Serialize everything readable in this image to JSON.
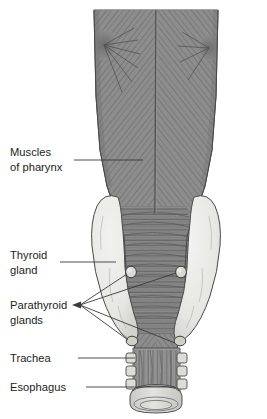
{
  "figure": {
    "view": "posterior",
    "background_color": "#ffffff",
    "width": 267,
    "height": 419
  },
  "palette": {
    "muscle_fill": "#8d8d8d",
    "muscle_fiber": "#5c5c5c",
    "muscle_dark": "#6f6f6f",
    "thyroid_fill": "#e9e9e6",
    "thyroid_shade": "#d3d3cf",
    "parathyroid_fill": "#d8d8d4",
    "trachea_fill": "#9a9a9a",
    "cartilage_fill": "#dcdcd8",
    "outline": "#4a4a4a",
    "leader_line": "#3b3b3b",
    "label_text": "#1d1d1d"
  },
  "labels": [
    {
      "id": "muscles-of-pharynx",
      "lines": [
        "Muscles",
        "of pharynx"
      ],
      "line1": "Muscles",
      "line2": "of pharynx",
      "text_x": 10,
      "text_y": 156,
      "leader": "single",
      "pointer_count": 1
    },
    {
      "id": "thyroid-gland",
      "lines": [
        "Thyroid",
        "gland"
      ],
      "line1": "Thyroid",
      "line2": "gland",
      "text_x": 10,
      "text_y": 259,
      "leader": "single",
      "pointer_count": 1
    },
    {
      "id": "parathyroid-glands",
      "lines": [
        "Parathyroid",
        "glands"
      ],
      "line1": "Parathyroid",
      "line2": "glands",
      "text_x": 10,
      "text_y": 309,
      "leader": "multi",
      "pointer_count": 4
    },
    {
      "id": "trachea",
      "lines": [
        "Trachea"
      ],
      "line1": "Trachea",
      "line2": "",
      "text_x": 10,
      "text_y": 356,
      "leader": "single",
      "pointer_count": 1
    },
    {
      "id": "esophagus",
      "lines": [
        "Esophagus"
      ],
      "line1": "Esophagus",
      "line2": "",
      "text_x": 10,
      "text_y": 385,
      "leader": "single",
      "pointer_count": 1
    }
  ],
  "structures": {
    "pharyngeal_muscles": {
      "name": "Muscles of pharynx",
      "description": "Pharyngeal constrictor muscles with obliquely striated fibers converging on a vertical median raphe",
      "fiber_pattern": "herringbone",
      "raphe": "median vertical"
    },
    "thyroid_gland": {
      "name": "Thyroid gland",
      "lobes": [
        "left lobe",
        "right lobe"
      ],
      "lobe_count": 2
    },
    "parathyroid_glands": {
      "name": "Parathyroid glands",
      "count": 4,
      "positions": [
        "superior left",
        "superior right",
        "inferior left",
        "inferior right"
      ]
    },
    "trachea": {
      "name": "Trachea",
      "feature": "tracheal cartilage rings",
      "ring_count": 4
    },
    "esophagus": {
      "name": "Esophagus",
      "feature": "muscular tube posterior to trachea"
    }
  }
}
